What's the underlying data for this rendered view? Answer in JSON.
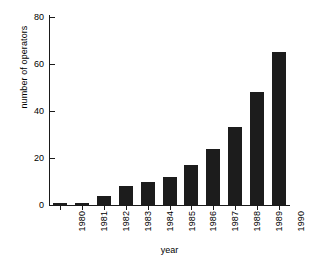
{
  "chart_data": {
    "type": "bar",
    "title": "",
    "xlabel": "year",
    "ylabel": "number of operators",
    "categories": [
      "1980",
      "1981",
      "1982",
      "1983",
      "1984",
      "1985",
      "1986",
      "1987",
      "1988",
      "1989",
      "1990"
    ],
    "values": [
      1,
      1,
      4,
      8,
      10,
      12,
      17,
      24,
      33,
      48,
      65
    ],
    "ylim": [
      0,
      80
    ],
    "yticks": [
      0,
      20,
      40,
      60,
      80
    ],
    "ytick_labels": [
      "0",
      "20",
      "40",
      "60",
      "80"
    ],
    "grid": false,
    "legend": null,
    "bar_color": "#1c1c1c",
    "axis_color": "#1a1a1a",
    "background_color": "#ffffff",
    "series": [
      {
        "name": "number of operators",
        "values": [
          1,
          1,
          4,
          8,
          10,
          12,
          17,
          24,
          33,
          48,
          65
        ]
      }
    ]
  }
}
